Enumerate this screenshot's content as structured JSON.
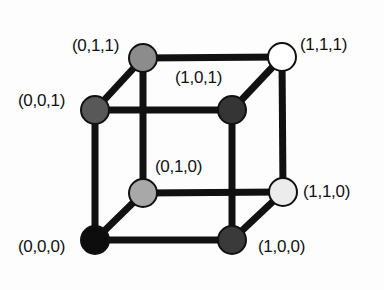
{
  "figure": {
    "kind": "rgb-color-cube-diagram",
    "background_color": "#fdfdfd",
    "edge_color": "#111111",
    "edge_width_px": 7,
    "node_radius_px": 14,
    "node_outline_color": "#111111",
    "label_color": "#111111",
    "label_font_size_px": 17
  },
  "chart_data": {
    "type": "diagram",
    "title": "",
    "xlabel": "",
    "ylabel": "",
    "vertices": [
      {
        "id": "v011",
        "label": "(0,1,1)",
        "coords": [
          0,
          1,
          1
        ],
        "x": 143,
        "y": 58,
        "fill": "#8c8c8c",
        "label_x": 72,
        "label_y": 37,
        "label_anchor": "left"
      },
      {
        "id": "v111",
        "label": "(1,1,1)",
        "coords": [
          1,
          1,
          1
        ],
        "x": 282,
        "y": 57,
        "fill": "#ffffff",
        "label_x": 300,
        "label_y": 36,
        "label_anchor": "left"
      },
      {
        "id": "v001",
        "label": "(0,0,1)",
        "coords": [
          0,
          0,
          1
        ],
        "x": 95,
        "y": 110,
        "fill": "#585858",
        "label_x": 18,
        "label_y": 92,
        "label_anchor": "left"
      },
      {
        "id": "v101",
        "label": "(1,0,1)",
        "coords": [
          1,
          0,
          1
        ],
        "x": 232,
        "y": 110,
        "fill": "#353535",
        "label_x": 175,
        "label_y": 69,
        "label_anchor": "left"
      },
      {
        "id": "v010",
        "label": "(0,1,0)",
        "coords": [
          0,
          1,
          0
        ],
        "x": 143,
        "y": 193,
        "fill": "#a8a8a8",
        "label_x": 155,
        "label_y": 158,
        "label_anchor": "left"
      },
      {
        "id": "v110",
        "label": "(1,1,0)",
        "coords": [
          1,
          1,
          0
        ],
        "x": 283,
        "y": 192,
        "fill": "#ececec",
        "label_x": 303,
        "label_y": 183,
        "label_anchor": "left"
      },
      {
        "id": "v000",
        "label": "(0,0,0)",
        "coords": [
          0,
          0,
          0
        ],
        "x": 95,
        "y": 240,
        "fill": "#0d0d0d",
        "label_x": 18,
        "label_y": 238,
        "label_anchor": "left"
      },
      {
        "id": "v100",
        "label": "(1,0,0)",
        "coords": [
          1,
          0,
          0
        ],
        "x": 232,
        "y": 240,
        "fill": "#3a3a3a",
        "label_x": 258,
        "label_y": 238,
        "label_anchor": "left"
      }
    ],
    "edges": [
      {
        "from": "v000",
        "to": "v100",
        "axis": "x"
      },
      {
        "from": "v001",
        "to": "v101",
        "axis": "x"
      },
      {
        "from": "v010",
        "to": "v110",
        "axis": "x"
      },
      {
        "from": "v011",
        "to": "v111",
        "axis": "x"
      },
      {
        "from": "v000",
        "to": "v010",
        "axis": "y"
      },
      {
        "from": "v100",
        "to": "v110",
        "axis": "y"
      },
      {
        "from": "v001",
        "to": "v011",
        "axis": "y"
      },
      {
        "from": "v101",
        "to": "v111",
        "axis": "y"
      },
      {
        "from": "v000",
        "to": "v001",
        "axis": "z"
      },
      {
        "from": "v100",
        "to": "v101",
        "axis": "z"
      },
      {
        "from": "v010",
        "to": "v011",
        "axis": "z"
      },
      {
        "from": "v110",
        "to": "v111",
        "axis": "z"
      }
    ]
  }
}
